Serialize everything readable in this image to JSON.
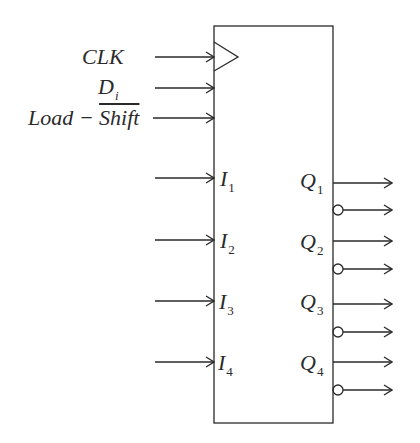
{
  "diagram": {
    "type": "block-diagram",
    "colors": {
      "stroke": "#2a2a2a",
      "background": "#ffffff"
    },
    "control_inputs": [
      {
        "id": "clk",
        "label": "CLK",
        "y": 57,
        "clock_triangle": true
      },
      {
        "id": "di",
        "label": "D",
        "subscript": "i",
        "y": 88
      },
      {
        "id": "load_shift",
        "label_plain": "Load − ",
        "label_overline": "Shift",
        "y": 118
      }
    ],
    "parallel_inputs": [
      {
        "label": "I",
        "subscript": "1",
        "y": 178
      },
      {
        "label": "I",
        "subscript": "2",
        "y": 240
      },
      {
        "label": "I",
        "subscript": "3",
        "y": 301
      },
      {
        "label": "I",
        "subscript": "4",
        "y": 362
      }
    ],
    "outputs": [
      {
        "label": "Q",
        "subscript": "1",
        "y": 183,
        "complement_y": 210
      },
      {
        "label": "Q",
        "subscript": "2",
        "y": 241,
        "complement_y": 269
      },
      {
        "label": "Q",
        "subscript": "3",
        "y": 304,
        "complement_y": 332
      },
      {
        "label": "Q",
        "subscript": "4",
        "y": 362,
        "complement_y": 390
      }
    ],
    "box": {
      "x": 214,
      "y": 26,
      "width": 119,
      "height": 397
    }
  }
}
